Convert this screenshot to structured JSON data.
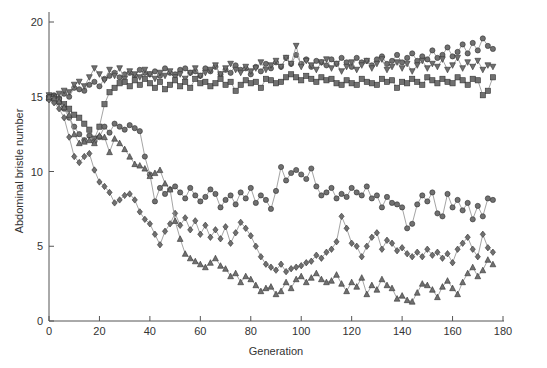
{
  "chart_data": {
    "type": "line",
    "title": "",
    "xlabel": "Generation",
    "ylabel": "Abdominal bristle number",
    "xlim": [
      0,
      180
    ],
    "ylim": [
      0,
      20
    ],
    "xticks": [
      0,
      20,
      40,
      60,
      80,
      100,
      120,
      140,
      160,
      180
    ],
    "yticks": [
      0,
      5,
      10,
      15,
      20
    ],
    "grid": false,
    "legend": null,
    "x": [
      0,
      2,
      4,
      6,
      8,
      10,
      12,
      14,
      16,
      18,
      20,
      22,
      24,
      26,
      28,
      30,
      32,
      34,
      36,
      38,
      40,
      42,
      44,
      46,
      48,
      50,
      52,
      54,
      56,
      58,
      60,
      62,
      64,
      66,
      68,
      70,
      72,
      74,
      76,
      78,
      80,
      82,
      84,
      86,
      88,
      90,
      92,
      94,
      96,
      98,
      100,
      102,
      104,
      106,
      108,
      110,
      112,
      114,
      116,
      118,
      120,
      122,
      124,
      126,
      128,
      130,
      132,
      134,
      136,
      138,
      140,
      142,
      144,
      146,
      148,
      150,
      152,
      154,
      156,
      158,
      160,
      162,
      164,
      166,
      168,
      170,
      172,
      174,
      176
    ],
    "series": [
      {
        "name": "Line A (circles, upper)",
        "marker": "circle",
        "values": [
          15.0,
          15.1,
          14.9,
          15.2,
          15.0,
          15.6,
          15.5,
          15.4,
          15.8,
          16.0,
          15.7,
          16.2,
          16.4,
          16.6,
          16.3,
          16.5,
          16.6,
          16.4,
          16.8,
          16.6,
          16.5,
          16.7,
          16.4,
          16.9,
          16.6,
          16.5,
          16.8,
          16.9,
          16.6,
          16.7,
          16.4,
          16.9,
          16.7,
          17.0,
          16.5,
          16.8,
          16.6,
          17.1,
          16.8,
          16.9,
          16.5,
          17.0,
          16.7,
          17.2,
          16.9,
          17.3,
          17.0,
          17.6,
          17.2,
          17.8,
          17.2,
          17.5,
          17.0,
          17.4,
          17.3,
          17.1,
          17.5,
          17.2,
          17.6,
          17.3,
          17.0,
          17.6,
          17.3,
          17.4,
          17.1,
          17.5,
          17.7,
          17.2,
          17.4,
          17.8,
          17.3,
          17.6,
          17.9,
          17.4,
          17.7,
          17.5,
          18.1,
          17.6,
          17.8,
          18.3,
          17.7,
          18.0,
          18.5,
          17.9,
          18.6,
          18.1,
          18.9,
          18.4,
          18.2
        ]
      },
      {
        "name": "Line B (inverted triangles, upper)",
        "marker": "triangle-down",
        "values": [
          15.1,
          15.0,
          15.2,
          15.4,
          15.3,
          15.8,
          16.0,
          15.7,
          16.3,
          16.9,
          16.5,
          16.1,
          16.8,
          16.4,
          16.9,
          16.2,
          16.7,
          16.5,
          16.3,
          16.8,
          16.5,
          16.2,
          16.6,
          16.4,
          16.7,
          16.3,
          16.5,
          16.2,
          16.6,
          16.9,
          16.4,
          16.6,
          16.8,
          17.1,
          16.5,
          16.9,
          17.2,
          16.8,
          16.6,
          17.0,
          16.7,
          16.9,
          17.3,
          16.8,
          17.1,
          17.4,
          17.0,
          17.6,
          17.2,
          18.4,
          17.0,
          17.4,
          17.1,
          16.8,
          17.3,
          17.5,
          16.9,
          17.2,
          16.7,
          17.0,
          17.3,
          16.8,
          17.1,
          17.4,
          16.9,
          17.2,
          17.5,
          16.8,
          17.0,
          17.3,
          16.9,
          17.2,
          16.7,
          17.1,
          17.4,
          16.9,
          17.2,
          17.0,
          17.5,
          16.8,
          17.1,
          17.6,
          16.9,
          17.3,
          17.0,
          17.4,
          16.8,
          17.1,
          17.0
        ]
      },
      {
        "name": "Line C (squares, upper)",
        "marker": "square",
        "values": [
          14.9,
          15.0,
          14.8,
          14.5,
          14.2,
          13.8,
          13.6,
          13.2,
          12.8,
          12.2,
          13.0,
          14.5,
          15.3,
          15.6,
          15.9,
          16.0,
          15.7,
          16.1,
          15.8,
          16.2,
          15.9,
          15.6,
          16.0,
          15.5,
          15.8,
          16.1,
          15.7,
          16.0,
          15.6,
          16.2,
          15.9,
          16.0,
          15.7,
          15.9,
          16.2,
          15.8,
          16.0,
          15.4,
          15.8,
          16.1,
          15.9,
          16.0,
          15.6,
          16.2,
          16.1,
          15.9,
          16.0,
          16.3,
          16.5,
          16.3,
          16.1,
          16.4,
          16.2,
          16.0,
          16.3,
          16.1,
          16.2,
          15.9,
          15.8,
          16.1,
          15.9,
          15.8,
          16.2,
          16.0,
          15.9,
          15.8,
          16.2,
          16.0,
          16.1,
          15.6,
          16.0,
          15.9,
          16.2,
          16.0,
          15.8,
          16.3,
          16.1,
          15.9,
          16.2,
          16.0,
          15.9,
          16.3,
          16.1,
          15.8,
          16.2,
          16.1,
          15.1,
          15.4,
          16.3
        ]
      },
      {
        "name": "Line D (circles, lower)",
        "marker": "circle",
        "values": [
          15.0,
          14.9,
          14.6,
          14.2,
          13.6,
          13.0,
          12.5,
          12.1,
          12.4,
          12.0,
          12.3,
          13.0,
          12.6,
          13.2,
          13.0,
          12.8,
          13.1,
          12.9,
          12.7,
          11.0,
          9.8,
          8.0,
          8.9,
          8.5,
          8.8,
          9.0,
          8.6,
          8.2,
          8.9,
          8.4,
          8.0,
          8.3,
          8.8,
          8.5,
          7.6,
          8.1,
          8.4,
          7.8,
          8.6,
          8.2,
          8.9,
          7.9,
          8.4,
          8.1,
          7.5,
          8.7,
          10.3,
          9.4,
          9.9,
          10.1,
          9.8,
          9.5,
          10.2,
          9.0,
          8.4,
          8.6,
          8.9,
          8.2,
          8.5,
          8.3,
          8.9,
          8.6,
          8.4,
          9.0,
          8.2,
          8.4,
          7.6,
          8.3,
          7.9,
          7.8,
          7.6,
          6.2,
          6.5,
          7.8,
          8.4,
          8.0,
          8.6,
          7.2,
          7.0,
          8.5,
          7.6,
          8.1,
          7.4,
          7.9,
          6.8,
          7.7,
          7.0,
          8.2,
          8.1
        ]
      },
      {
        "name": "Line E (diamonds)",
        "marker": "diamond",
        "values": [
          14.8,
          14.6,
          14.2,
          13.6,
          12.3,
          11.0,
          10.6,
          11.0,
          11.2,
          10.1,
          9.3,
          9.0,
          8.6,
          7.9,
          8.1,
          8.4,
          8.5,
          8.1,
          7.3,
          6.8,
          6.5,
          5.8,
          5.1,
          6.0,
          6.5,
          7.2,
          6.4,
          6.9,
          6.1,
          6.7,
          5.8,
          6.4,
          5.6,
          6.1,
          5.5,
          6.3,
          5.2,
          5.9,
          6.6,
          6.2,
          5.7,
          5.0,
          4.3,
          3.8,
          3.6,
          3.4,
          3.8,
          3.3,
          3.5,
          3.6,
          3.7,
          3.9,
          4.0,
          4.4,
          4.2,
          4.6,
          4.8,
          5.3,
          7.0,
          6.2,
          5.2,
          5.0,
          4.3,
          5.0,
          5.6,
          5.9,
          4.8,
          5.4,
          5.2,
          4.7,
          4.9,
          4.5,
          4.3,
          4.6,
          4.3,
          4.8,
          4.4,
          4.6,
          4.2,
          4.5,
          3.9,
          4.8,
          5.2,
          5.6,
          4.8,
          4.3,
          5.8,
          4.9,
          4.6
        ]
      },
      {
        "name": "Line F (triangles)",
        "marker": "triangle",
        "values": [
          15.0,
          14.9,
          14.7,
          14.3,
          13.8,
          12.5,
          11.9,
          12.0,
          12.1,
          11.9,
          12.4,
          12.3,
          11.3,
          12.2,
          11.9,
          11.5,
          11.0,
          10.5,
          10.4,
          10.2,
          9.7,
          9.9,
          10.1,
          9.2,
          8.8,
          6.7,
          5.5,
          4.5,
          4.2,
          4.0,
          3.8,
          3.6,
          3.9,
          4.2,
          3.7,
          3.5,
          3.0,
          3.2,
          2.6,
          3.0,
          2.8,
          2.4,
          2.0,
          2.2,
          2.3,
          1.8,
          2.0,
          2.6,
          2.2,
          2.8,
          3.0,
          2.6,
          2.9,
          3.2,
          2.8,
          2.6,
          2.7,
          3.1,
          2.5,
          2.0,
          2.6,
          2.3,
          2.9,
          1.8,
          2.4,
          2.1,
          2.8,
          2.4,
          2.2,
          1.5,
          1.7,
          1.4,
          1.3,
          1.9,
          2.5,
          2.4,
          2.1,
          1.6,
          2.3,
          2.7,
          2.2,
          1.8,
          2.6,
          3.2,
          3.6,
          3.0,
          3.4,
          4.1,
          3.8
        ]
      }
    ]
  },
  "figure": {
    "ylabel": "Abdominal bristle number",
    "xlabel": "Generation",
    "x_tick_labels": [
      "0",
      "20",
      "40",
      "60",
      "80",
      "100",
      "120",
      "140",
      "160",
      "180"
    ],
    "y_tick_labels": [
      "0",
      "5",
      "10",
      "15",
      "20"
    ],
    "marker_fill": "#707070",
    "marker_stroke": "#333333",
    "line_color": "#9a9a9a"
  }
}
